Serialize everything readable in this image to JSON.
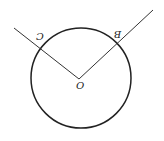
{
  "diagram": {
    "type": "circle-with-central-angle",
    "orientation": "rotated 180 degrees",
    "labels": {
      "center": "O",
      "point_b": "B",
      "point_c": "C"
    },
    "colors": {
      "stroke": "#222222",
      "background": "#ffffff"
    }
  }
}
